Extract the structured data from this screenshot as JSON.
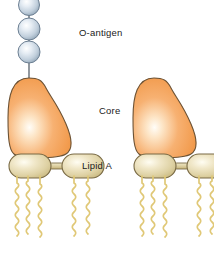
{
  "figure": {
    "name": "lipopolysaccharide-structure",
    "background": "#ffffff",
    "width": 214,
    "height": 260
  },
  "labels": {
    "o_antigen": "O-antigen",
    "core": "Core",
    "lipid_a": "Lipid A"
  },
  "colors": {
    "sphere_fill_light": "#f2f6fa",
    "sphere_fill_mid": "#c9d6e2",
    "sphere_fill_dark": "#8fa3b5",
    "sphere_stroke": "#6c7f92",
    "core_fill_light": "#fff7ec",
    "core_fill_mid": "#f6a85c",
    "core_fill_dark": "#e8913f",
    "core_stroke": "#6b5235",
    "lipid_fill_light": "#fbf6e4",
    "lipid_fill_mid": "#ddd0a2",
    "lipid_fill_dark": "#c9b981",
    "lipid_stroke": "#7a6b46",
    "chain_stroke": "#e0c877",
    "connector_stroke": "#57616b",
    "text": "#1a1a1a"
  },
  "structure": {
    "o_antigen_chain": {
      "name": "o-antigen-sugar-chain",
      "sphere_count": 3,
      "spheres": [
        {
          "cx": 29,
          "cy": 6,
          "r": 10
        },
        {
          "cx": 29,
          "cy": 29,
          "r": 11
        },
        {
          "cx": 29,
          "cy": 52,
          "r": 11
        }
      ],
      "connectors": [
        {
          "x1": 29,
          "y1": 16,
          "x2": 29,
          "y2": 19
        },
        {
          "x1": 29,
          "y1": 40,
          "x2": 29,
          "y2": 42
        },
        {
          "x1": 29,
          "y1": 63,
          "x2": 29,
          "y2": 76
        }
      ]
    },
    "units": [
      {
        "name": "lps-unit-left",
        "has_o_antigen": true,
        "core_x": 47,
        "lipid_a": {
          "left_capsule": {
            "cx": 30,
            "cy": 166,
            "rx": 21,
            "ry": 12,
            "chains": 3
          },
          "right_capsule": {
            "cx": 83,
            "cy": 166,
            "rx": 21,
            "ry": 12,
            "chains": 2
          },
          "bridge": {
            "x1": 51,
            "y1": 166,
            "x2": 62,
            "y2": 166
          }
        }
      },
      {
        "name": "lps-unit-right",
        "has_o_antigen": false,
        "core_x": 172,
        "lipid_a": {
          "left_capsule": {
            "cx": 155,
            "cy": 166,
            "rx": 21,
            "ry": 12,
            "chains": 3
          },
          "right_capsule": {
            "cx": 208,
            "cy": 166,
            "rx": 21,
            "ry": 12,
            "chains": 2
          },
          "bridge": {
            "x1": 176,
            "y1": 166,
            "x2": 187,
            "y2": 166
          }
        }
      }
    ]
  }
}
